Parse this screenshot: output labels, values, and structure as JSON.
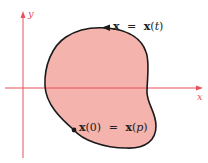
{
  "diagram": {
    "type": "closed parametric curve in the plane",
    "axes": {
      "x_label": "x",
      "y_label": "y",
      "color": "#e8505a"
    },
    "region": {
      "fill_color": "#f4b3ad",
      "stroke_color": "#1a1a1a"
    },
    "labels": {
      "curve_label": {
        "vec": "x",
        "eq": "=",
        "func_vec": "x",
        "open": "(",
        "param": "t",
        "close": ")"
      },
      "point_label": {
        "vec1": "x",
        "open1": "(",
        "arg1": "0",
        "close1": ")",
        "eq": "=",
        "vec2": "x",
        "open2": "(",
        "param2": "p",
        "close2": ")"
      }
    },
    "markers": {
      "direction_arrow": "counterclockwise",
      "start_point": "x(0)"
    }
  }
}
